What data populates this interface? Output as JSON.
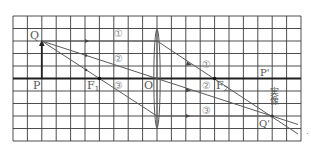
{
  "diagram": {
    "type": "convex-lens-ray-diagram",
    "grid": {
      "columns": 20,
      "rows": 10,
      "left": 13,
      "top": 16,
      "cell_w": 14.4,
      "cell_h": 12.5
    },
    "colors": {
      "grid": "#333333",
      "axis": "#222222",
      "ray": "#555555",
      "label": "#555555",
      "circled": "#888888"
    },
    "points": {
      "Q": {
        "label": "Q",
        "col": 2,
        "row": 2
      },
      "P": {
        "label": "P",
        "col": 2,
        "row": 5
      },
      "F1": {
        "label": "F",
        "sub": "1",
        "col": 6,
        "row": 5
      },
      "O": {
        "label": "O",
        "col": 10,
        "row": 5
      },
      "F2": {
        "label": "F",
        "sub": "2",
        "col": 14,
        "row": 5
      },
      "P_prime": {
        "label": "P'",
        "col": 18,
        "row": 5
      },
      "Q_prime": {
        "label": "Q'",
        "col": 18,
        "row": 8
      }
    },
    "ray_labels": {
      "left": [
        "①",
        "②",
        "③"
      ],
      "right": [
        "①",
        "②",
        "③"
      ]
    },
    "image_label": "実像",
    "trailing_mark": "."
  }
}
